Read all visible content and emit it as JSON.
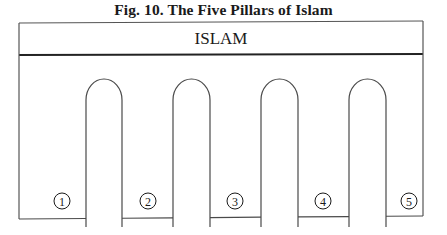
{
  "figure": {
    "title": "Fig. 10.  The Five Pillars of Islam"
  },
  "diagram": {
    "header_label": "ISLAM",
    "pillars": [
      {
        "number": "1"
      },
      {
        "number": "2"
      },
      {
        "number": "3"
      },
      {
        "number": "4"
      },
      {
        "number": "5"
      }
    ],
    "line_color": "#4a4a4a",
    "header_line_color": "#222222"
  }
}
